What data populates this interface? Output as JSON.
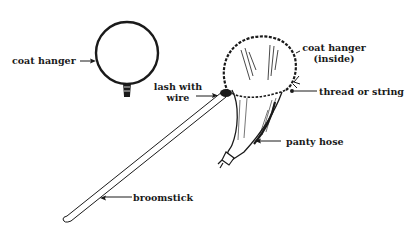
{
  "diagram": {
    "title": "",
    "colors": {
      "ink": "#1a1a1a",
      "background": "#ffffff"
    },
    "labels": {
      "coat_hanger_left": "coat hanger",
      "lash_with_wire_line1": "lash with",
      "lash_with_wire_line2": "wire",
      "coat_hanger_inside_line1": "coat hanger",
      "coat_hanger_inside_line2": "(inside)",
      "thread_or_string": "thread or string",
      "panty_hose": "panty hose",
      "broomstick": "broomstick"
    },
    "parts": [
      {
        "id": "bent-coat-hanger-loop",
        "label": "coat hanger"
      },
      {
        "id": "lashing",
        "label": "lash with wire"
      },
      {
        "id": "net-rim",
        "label": "coat hanger (inside)"
      },
      {
        "id": "tie",
        "label": "thread or string"
      },
      {
        "id": "net-bag",
        "label": "panty hose"
      },
      {
        "id": "handle",
        "label": "broomstick"
      }
    ]
  }
}
